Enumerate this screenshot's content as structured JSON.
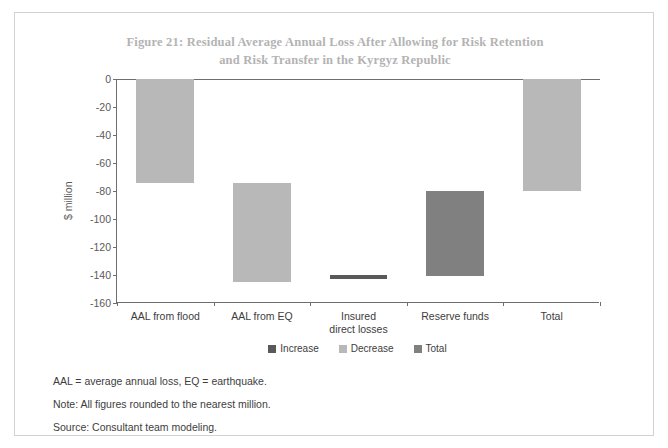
{
  "figure": {
    "title": "Figure 21: Residual Average Annual Loss After Allowing for Risk Retention and Risk Transfer in the Kyrgyz Republic",
    "title_line1": "Figure 21: Residual Average Annual Loss After Allowing for Risk Retention",
    "title_line2": "and Risk Transfer in the Kyrgyz Republic",
    "notes": [
      "AAL = average annual loss, EQ = earthquake.",
      "Note: All figures rounded to the nearest million.",
      "Source: Consultant team modeling."
    ]
  },
  "colors": {
    "increase": "#595959",
    "decrease": "#b8b8b8",
    "total": "#808080",
    "axis": "#6e6e6e",
    "title": "#b3b3b3",
    "text": "#3d3d3d"
  },
  "chart_data": {
    "type": "bar",
    "subtype": "waterfall",
    "title": "Figure 21: Residual Average Annual Loss After Allowing for Risk Retention and Risk Transfer in the Kyrgyz Republic",
    "xlabel": "",
    "ylabel": "$ million",
    "ylim": [
      -160,
      0
    ],
    "ytick_step": 20,
    "ytick_labels": [
      "0",
      "-20",
      "-40",
      "-60",
      "-80",
      "-100",
      "-120",
      "-140",
      "-160"
    ],
    "ytick_values": [
      0,
      -20,
      -40,
      -60,
      -80,
      -100,
      -120,
      -140,
      -160
    ],
    "grid": false,
    "legend_position": "bottom",
    "legend": [
      "Increase",
      "Decrease",
      "Total"
    ],
    "categories": [
      "AAL from flood",
      "AAL from EQ",
      "Insured direct losses",
      "Reserve funds",
      "Total"
    ],
    "category_labels": [
      "AAL from flood",
      "AAL from EQ",
      "Insured\ndirect losses",
      "Reserve funds",
      "Total"
    ],
    "bars": [
      {
        "category": "AAL from flood",
        "start": 0,
        "end": -74,
        "delta": -74,
        "kind": "Decrease"
      },
      {
        "category": "AAL from EQ",
        "start": -74,
        "end": -145,
        "delta": -71,
        "kind": "Decrease"
      },
      {
        "category": "Insured direct losses",
        "start": -140,
        "end": -143,
        "delta": 3,
        "kind": "Increase"
      },
      {
        "category": "Reserve funds",
        "start": -80,
        "end": -141,
        "delta": 61,
        "kind": "Increase"
      },
      {
        "category": "Total",
        "start": 0,
        "end": -80,
        "delta": -80,
        "kind": "Decrease"
      }
    ],
    "values": [
      -74,
      -71,
      3,
      61,
      -80
    ]
  }
}
